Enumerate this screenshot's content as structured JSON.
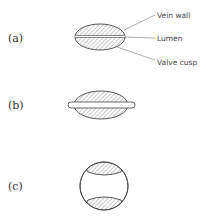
{
  "panels": [
    {
      "id": "a",
      "label": "(a)",
      "description": "Closed valve: elliptical vein with two hatched valve cusps meeting at a slit lumen",
      "callouts": [
        {
          "text": "Vein wall"
        },
        {
          "text": "Lumen"
        },
        {
          "text": "Valve cusp"
        }
      ]
    },
    {
      "id": "b",
      "label": "(b)",
      "description": "Flattened vein with hatched cusps separated by a narrow tubular lumen protruding at both ends"
    },
    {
      "id": "c",
      "label": "(c)",
      "description": "Open valve: circular vein with hatched cusps retracted to top and bottom"
    }
  ],
  "colors": {
    "line": "#444444",
    "hatch": "#666666",
    "background": "#ffffff"
  }
}
